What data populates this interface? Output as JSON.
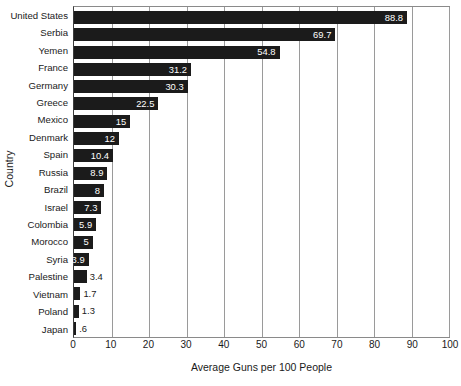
{
  "chart_data": {
    "type": "bar",
    "orientation": "horizontal",
    "title": "",
    "xlabel": "Average Guns per 100 People",
    "ylabel": "Country",
    "xlim": [
      0,
      100
    ],
    "xticks": [
      0,
      10,
      20,
      30,
      40,
      50,
      60,
      70,
      80,
      90,
      100
    ],
    "grid": true,
    "legend": null,
    "bar_color": "#1b1b1b",
    "categories": [
      "United States",
      "Serbia",
      "Yemen",
      "France",
      "Germany",
      "Greece",
      "Mexico",
      "Denmark",
      "Spain",
      "Russia",
      "Brazil",
      "Israel",
      "Colombia",
      "Morocco",
      "Syria",
      "Palestine",
      "Vietnam",
      "Poland",
      "Japan"
    ],
    "values": [
      88.8,
      69.7,
      54.8,
      31.2,
      30.3,
      22.5,
      15,
      12,
      10.4,
      8.9,
      8,
      7.3,
      5.9,
      5,
      3.9,
      3.4,
      1.7,
      1.3,
      0.6
    ],
    "value_labels": [
      "88.8",
      "69.7",
      "54.8",
      "31.2",
      "30.3",
      "22.5",
      "15",
      "12",
      "10.4",
      "8.9",
      "8",
      "7.3",
      "5.9",
      "5",
      "3.9",
      "3.4",
      "1.7",
      "1.3",
      ".6"
    ],
    "label_placement": [
      "inside",
      "inside",
      "inside",
      "inside",
      "inside",
      "inside",
      "inside",
      "inside",
      "inside",
      "inside",
      "inside",
      "inside",
      "inside",
      "inside",
      "inside",
      "outside",
      "outside",
      "outside",
      "outside"
    ]
  }
}
